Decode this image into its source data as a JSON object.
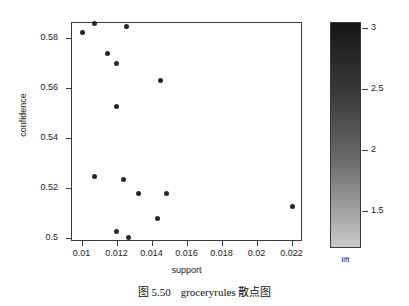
{
  "caption": {
    "number": "图 5.50",
    "text": "groceryrules 散点图"
  },
  "chart_data": {
    "type": "scatter",
    "title": "",
    "xlabel": "support",
    "ylabel": "confidence",
    "xlim": [
      0.0094,
      0.0226
    ],
    "ylim": [
      0.4986,
      0.5864
    ],
    "grid": false,
    "xticks": [
      0.01,
      0.012,
      0.014,
      0.016,
      0.018,
      0.02,
      0.022
    ],
    "xticklabels": [
      "0.01",
      "0.012",
      "0.014",
      "0.016",
      "0.018",
      "0.02",
      "0.022"
    ],
    "yticks": [
      0.5,
      0.52,
      0.54,
      0.56,
      0.58
    ],
    "yticklabels": [
      "0.5",
      "0.52",
      "0.54",
      "0.56",
      "0.58"
    ],
    "marker": "filled-circle",
    "marker_color": "#262626",
    "points": [
      {
        "x": 0.01007,
        "y": 0.5823
      },
      {
        "x": 0.01074,
        "y": 0.586
      },
      {
        "x": 0.01258,
        "y": 0.5844
      },
      {
        "x": 0.01147,
        "y": 0.5739
      },
      {
        "x": 0.01202,
        "y": 0.5697
      },
      {
        "x": 0.01453,
        "y": 0.563
      },
      {
        "x": 0.01202,
        "y": 0.5527
      },
      {
        "x": 0.01077,
        "y": 0.5244
      },
      {
        "x": 0.01239,
        "y": 0.5231
      },
      {
        "x": 0.01323,
        "y": 0.5177
      },
      {
        "x": 0.01485,
        "y": 0.5177
      },
      {
        "x": 0.01434,
        "y": 0.5076
      },
      {
        "x": 0.012,
        "y": 0.5025
      },
      {
        "x": 0.01267,
        "y": 0.5
      },
      {
        "x": 0.02207,
        "y": 0.5126
      }
    ],
    "colorbar": {
      "label": "lift",
      "ticks": [
        1.5,
        2,
        2.5,
        3
      ],
      "ticklabels": [
        "1.5",
        "2",
        "2.5",
        "3"
      ],
      "vmin": 1.2,
      "vmax": 3.05,
      "gradient_top_color": "#161616",
      "gradient_bottom_color": "#c9c9c9",
      "orientation": "vertical"
    }
  }
}
